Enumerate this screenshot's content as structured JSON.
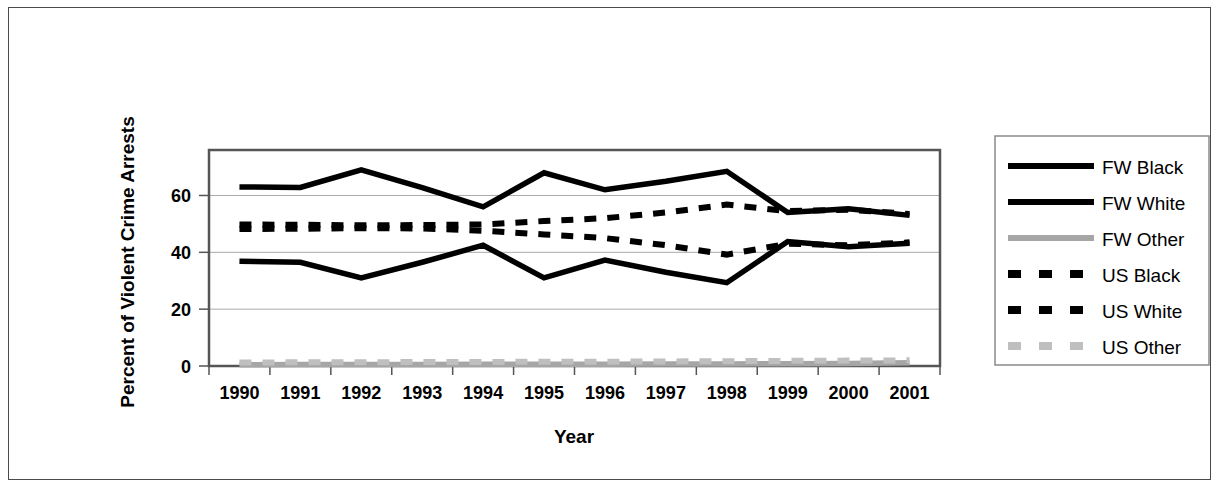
{
  "chart_data": {
    "type": "line",
    "title": "",
    "xlabel": "Year",
    "ylabel": "Percent of Violent Crime Arrests",
    "categories": [
      "1990",
      "1991",
      "1992",
      "1993",
      "1994",
      "1995",
      "1996",
      "1997",
      "1998",
      "1999",
      "2000",
      "2001"
    ],
    "x": [
      1990,
      1991,
      1992,
      1993,
      1994,
      1995,
      1996,
      1997,
      1998,
      1999,
      2000,
      2001
    ],
    "xlim": [
      1989.5,
      2001.5
    ],
    "ylim": [
      0,
      76
    ],
    "yticks": [
      0,
      20,
      40,
      60
    ],
    "ytick_labels": [
      "0",
      "20",
      "40",
      "60"
    ],
    "grid": true,
    "legend_position": "right",
    "series": [
      {
        "name": "FW Black",
        "style": "solid",
        "color": "#000000",
        "values": [
          63.0,
          62.8,
          69.0,
          62.8,
          56.0,
          68.0,
          62.0,
          65.0,
          68.5,
          54.0,
          55.3,
          53.0
        ]
      },
      {
        "name": "FW White",
        "style": "solid",
        "color": "#000000",
        "values": [
          36.9,
          36.5,
          31.0,
          36.5,
          42.5,
          31.0,
          37.3,
          33.0,
          29.3,
          43.8,
          42.0,
          43.2
        ]
      },
      {
        "name": "FW Other",
        "style": "solid",
        "color": "#a6a6a6",
        "values": [
          0.4,
          0.5,
          0.5,
          0.5,
          0.6,
          0.6,
          0.6,
          0.7,
          0.7,
          0.8,
          0.9,
          1.1
        ]
      },
      {
        "name": "US Black",
        "style": "dashed",
        "color": "#000000",
        "values": [
          49.8,
          49.7,
          49.5,
          49.6,
          49.8,
          51.0,
          52.0,
          54.0,
          56.8,
          54.5,
          55.0,
          53.5
        ]
      },
      {
        "name": "US White",
        "style": "dashed",
        "color": "#000000",
        "values": [
          48.2,
          48.3,
          48.5,
          48.4,
          47.6,
          46.3,
          45.0,
          42.5,
          39.2,
          43.0,
          42.5,
          43.5
        ]
      },
      {
        "name": "US Other",
        "style": "dashed",
        "color": "#bfbfbf",
        "values": [
          1.2,
          1.3,
          1.3,
          1.4,
          1.4,
          1.5,
          1.5,
          1.6,
          1.7,
          1.8,
          1.9,
          2.0
        ]
      }
    ]
  },
  "axes": {
    "y_title": "Percent of Violent Crime Arrests",
    "x_title": "Year",
    "y_ticks": [
      "0",
      "20",
      "40",
      "60"
    ],
    "x_ticks": [
      "1990",
      "1991",
      "1992",
      "1993",
      "1994",
      "1995",
      "1996",
      "1997",
      "1998",
      "1999",
      "2000",
      "2001"
    ]
  },
  "legend": {
    "items": [
      {
        "label": "FW Black",
        "style": "solid",
        "color": "#000000"
      },
      {
        "label": "FW White",
        "style": "solid",
        "color": "#000000"
      },
      {
        "label": "FW Other",
        "style": "solid",
        "color": "#a6a6a6"
      },
      {
        "label": "US Black",
        "style": "dashed",
        "color": "#000000"
      },
      {
        "label": "US White",
        "style": "dashed",
        "color": "#000000"
      },
      {
        "label": "US Other",
        "style": "dashed",
        "color": "#bfbfbf"
      }
    ]
  },
  "colors": {
    "plot_border": "#555555",
    "gridline": "#aaaaaa",
    "frame": "#4a4a4a",
    "background": "#ffffff"
  }
}
